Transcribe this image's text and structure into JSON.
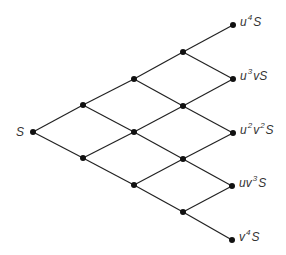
{
  "diagram": {
    "root_label": "S",
    "terminal_labels": [
      {
        "base": "u",
        "sup": "4",
        "rest": "",
        "sup2": "",
        "tail": "S"
      },
      {
        "base": "u",
        "sup": "3",
        "rest": "v",
        "sup2": "",
        "tail": "S"
      },
      {
        "base": "u",
        "sup": "2",
        "rest": "v",
        "sup2": "2",
        "tail": "S"
      },
      {
        "base": "uv",
        "sup": "3",
        "rest": "",
        "sup2": "",
        "tail": "S"
      },
      {
        "base": "v",
        "sup": "4",
        "rest": "",
        "sup2": "",
        "tail": "S"
      }
    ],
    "levels": [
      [
        [
          33,
          132
        ]
      ],
      [
        [
          83,
          105
        ],
        [
          83,
          158
        ]
      ],
      [
        [
          134,
          79
        ],
        [
          134,
          132
        ],
        [
          134,
          185
        ]
      ],
      [
        [
          183,
          52
        ],
        [
          183,
          106
        ],
        [
          183,
          159
        ],
        [
          183,
          212
        ]
      ],
      [
        [
          233,
          25
        ],
        [
          233,
          79
        ],
        [
          233,
          133
        ],
        [
          232,
          186
        ],
        [
          232,
          240
        ]
      ]
    ]
  }
}
